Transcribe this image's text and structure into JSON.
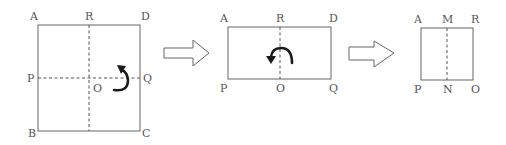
{
  "diagram": {
    "panels": [
      {
        "name": "square-unfolded",
        "labels": {
          "A": "A",
          "R": "R",
          "D": "D",
          "P": "P",
          "O": "O",
          "Q": "Q",
          "B": "B",
          "C": "C"
        },
        "fold_indicator": "fold-up-arrow"
      },
      {
        "name": "rectangle-folded-once",
        "labels": {
          "A": "A",
          "R": "R",
          "D": "D",
          "P": "P",
          "O": "O",
          "Q": "Q"
        },
        "fold_indicator": "fold-left-arrow"
      },
      {
        "name": "square-folded-twice",
        "labels": {
          "A": "A",
          "M": "M",
          "R": "R",
          "P": "P",
          "N": "N",
          "O": "O"
        }
      }
    ],
    "transition_arrows": [
      "right-arrow",
      "right-arrow"
    ],
    "colors": {
      "line": "#666666",
      "text": "#555555",
      "fold_arrow": "#1a1a1a"
    }
  }
}
